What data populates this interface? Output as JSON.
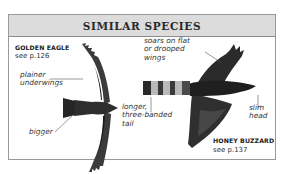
{
  "box": {
    "title": "SIMILAR SPECIES",
    "border_color": "#9a9a9a",
    "header_bg": "#dcdcdc"
  },
  "species": [
    {
      "name": "GOLDEN EAGLE",
      "page_ref": "see p.126",
      "annotations": [
        "plainer\nunderwings",
        "bigger"
      ]
    },
    {
      "name": "HONEY BUZZARD",
      "page_ref": "see p.137",
      "annotations": [
        "soars on flat\nor drooped\nwings",
        "longer,\nthree-banded\ntail",
        "slim\nhead"
      ]
    }
  ],
  "icons": {
    "golden_eagle": "golden-eagle-illustration",
    "honey_buzzard": "honey-buzzard-illustration"
  }
}
